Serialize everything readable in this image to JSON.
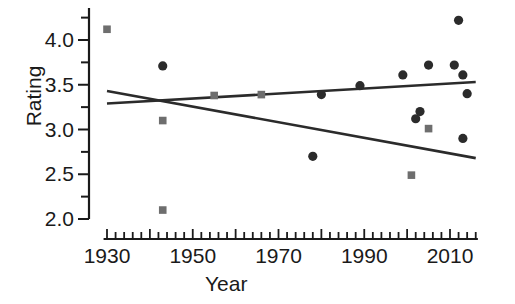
{
  "chart_data": {
    "type": "scatter",
    "title": "",
    "xlabel": "Year",
    "ylabel": "Rating",
    "xlim": [
      1926,
      2017
    ],
    "ylim": [
      1.95,
      4.32
    ],
    "xticks": [
      1930,
      1950,
      1970,
      1990,
      2010
    ],
    "xticklabels": [
      "1930",
      "1950",
      "1970",
      "1990",
      "2010"
    ],
    "x_minor_tick_step": 2,
    "yticks": [
      2.0,
      2.5,
      3.0,
      3.5,
      4.0
    ],
    "yticklabels": [
      "2.0",
      "2.5",
      "3.0",
      "3.5",
      "4.0"
    ],
    "y_minor_tick_step": 0.25,
    "grid": false,
    "legend": "none",
    "series": [
      {
        "name": "circles",
        "marker": "circle",
        "color": "#2b2b2b",
        "points": [
          {
            "x": 1943,
            "y": 3.71
          },
          {
            "x": 1978,
            "y": 2.7
          },
          {
            "x": 1980,
            "y": 3.39
          },
          {
            "x": 1989,
            "y": 3.49
          },
          {
            "x": 1999,
            "y": 3.61
          },
          {
            "x": 2002,
            "y": 3.12
          },
          {
            "x": 2003,
            "y": 3.2
          },
          {
            "x": 2005,
            "y": 3.72
          },
          {
            "x": 2011,
            "y": 3.72
          },
          {
            "x": 2012,
            "y": 4.22
          },
          {
            "x": 2013,
            "y": 3.61
          },
          {
            "x": 2014,
            "y": 3.4
          },
          {
            "x": 2013,
            "y": 2.9
          }
        ]
      },
      {
        "name": "squares",
        "marker": "square",
        "color": "#6e6e6e",
        "points": [
          {
            "x": 1930,
            "y": 4.12
          },
          {
            "x": 1943,
            "y": 3.1
          },
          {
            "x": 1943,
            "y": 2.1
          },
          {
            "x": 1955,
            "y": 3.38
          },
          {
            "x": 1966,
            "y": 3.39
          },
          {
            "x": 2005,
            "y": 3.01
          },
          {
            "x": 2001,
            "y": 2.49
          }
        ]
      }
    ],
    "trend_lines": [
      {
        "name": "declining-trend",
        "color": "#2b2b2b",
        "x0": 1930,
        "y0": 3.43,
        "x1": 2016,
        "y1": 2.68
      },
      {
        "name": "rising-trend",
        "color": "#2b2b2b",
        "x0": 1930,
        "y0": 3.29,
        "x1": 2016,
        "y1": 3.53
      }
    ]
  },
  "axes": {
    "x_title": "Year",
    "y_title": "Rating"
  }
}
